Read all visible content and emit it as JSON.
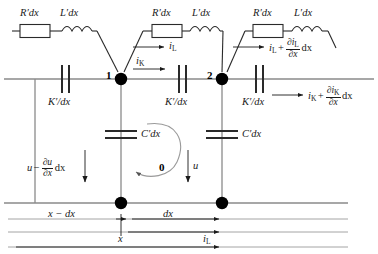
{
  "figure": {
    "type": "transmission-line-equivalent-circuit",
    "colors": {
      "wire": "#8a8a8a",
      "component_outline": "#2a2a2a",
      "node_dot": "#000000",
      "text": "#1a1a1a",
      "background": "#ffffff"
    }
  },
  "series_branch_labels": {
    "resistor_1": "R′dx",
    "inductor_1": "L′dx",
    "resistor_2": "R′dx",
    "inductor_2": "L′dx",
    "resistor_3": "R′dx",
    "inductor_3": "L′dx"
  },
  "shunt_labels": {
    "conductance_cap_left": "K′/dx",
    "conductance_cap_mid": "K′/dx",
    "conductance_cap_right": "K′/dx",
    "capacitor_left": "C′dx",
    "capacitor_right": "C′dx"
  },
  "nodes": {
    "node_1": "1",
    "node_2": "2",
    "loop_0": "0"
  },
  "currents": {
    "i_L_base": "i",
    "i_L_sub": "L",
    "i_K_base": "i",
    "i_K_sub": "K",
    "i_L_out_lead": "i",
    "i_L_out_sub": "L",
    "i_L_out_plus": "+",
    "i_L_out_num_partial": "∂i",
    "i_L_out_num_sub": "L",
    "i_L_out_den": "∂x",
    "i_L_out_tail": "dx",
    "i_K_out_lead": "i",
    "i_K_out_sub": "K",
    "i_K_out_plus": "+",
    "i_K_out_num_partial": "∂i",
    "i_K_out_num_sub": "K",
    "i_K_out_den": "∂x",
    "i_K_out_tail": "dx",
    "i_L_bottom_base": "i",
    "i_L_bottom_sub": "L"
  },
  "voltages": {
    "u_left_lead": "u",
    "u_left_minus": "−",
    "u_left_num": "∂u",
    "u_left_den": "∂x",
    "u_left_tail": "dx",
    "u_right": "u"
  },
  "axis": {
    "span_left": "x − dx",
    "span_dx": "dx",
    "span_x": "x"
  }
}
